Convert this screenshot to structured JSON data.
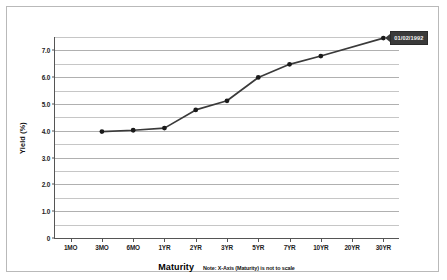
{
  "chart_data": {
    "type": "line",
    "title": "",
    "xlabel": "Maturity",
    "ylabel": "Yield (%)",
    "note": "Note: X-Axis (Maturity) is not to scale",
    "categories": [
      "1MO",
      "3MO",
      "6MO",
      "1YR",
      "2YR",
      "3YR",
      "5YR",
      "7YR",
      "10YR",
      "20YR",
      "30YR"
    ],
    "series": [
      {
        "name": "01/02/1992",
        "x": [
          "3MO",
          "6MO",
          "1YR",
          "2YR",
          "3YR",
          "5YR",
          "7YR",
          "10YR",
          "30YR"
        ],
        "values": [
          3.97,
          4.02,
          4.1,
          4.78,
          5.12,
          5.99,
          6.48,
          6.79,
          7.46
        ]
      }
    ],
    "ylim": [
      0,
      7.5
    ],
    "yticks": [
      0,
      1.0,
      2.0,
      3.0,
      4.0,
      5.0,
      6.0,
      7.0
    ],
    "ytick_labels": [
      "0",
      "1.0",
      "2.0",
      "3.0",
      "4.0",
      "5.0",
      "6.0",
      "7.0"
    ],
    "minor_ytick_step": 0.5,
    "grid": true,
    "legend": "none",
    "annotations": [
      {
        "text": "01/02/1992",
        "target_x": "30YR",
        "target_y": 7.46,
        "style": "callout-dark"
      }
    ],
    "colors": {
      "line": "#3a3a3a",
      "marker": "#1a1a1a",
      "grid": "#c6c6c6",
      "axis": "#555555",
      "callout_bg": "#3a3a3a",
      "callout_text": "#f2f2f2",
      "plot_bg": "#ffffff",
      "frame_border": "#b9b9b9"
    }
  }
}
